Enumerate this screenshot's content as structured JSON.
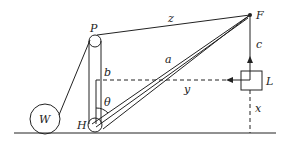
{
  "diagram": {
    "type": "mechanics-crane-schematic",
    "labels": {
      "P": "P",
      "F": "F",
      "z": "z",
      "c": "c",
      "a": "a",
      "b": "b",
      "theta": "θ",
      "y": "y",
      "L": "L",
      "x": "x",
      "W": "W",
      "H": "H"
    },
    "colors": {
      "stroke": "#222222",
      "background": "#ffffff"
    }
  }
}
